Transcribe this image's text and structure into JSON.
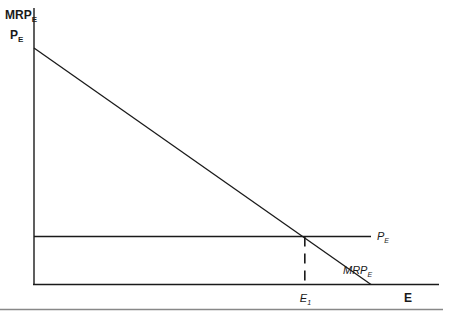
{
  "chart_data": {
    "type": "line",
    "title": "",
    "ylabel_line1": "MRP",
    "ylabel_line1_sub": "E",
    "ylabel_line2": "P",
    "ylabel_line2_sub": "E",
    "xlabel": "E",
    "xlim": [
      0,
      1
    ],
    "ylim": [
      0,
      1
    ],
    "grid": false,
    "series": [
      {
        "name": "MRP",
        "name_sub": "E",
        "style": "solid",
        "points": [
          [
            0,
            1.0
          ],
          [
            0.83,
            0.0
          ]
        ]
      },
      {
        "name": "P",
        "name_sub": "E",
        "style": "solid",
        "points": [
          [
            0,
            0.203
          ],
          [
            0.83,
            0.203
          ]
        ],
        "extends_to_x": 0.83
      }
    ],
    "annotations": [
      {
        "label": "E",
        "label_sub": "1",
        "type": "dashed-vertical",
        "x": 0.667,
        "y_from": 0,
        "y_to": 0.203
      }
    ]
  }
}
